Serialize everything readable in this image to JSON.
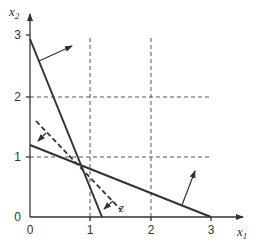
{
  "diagram": {
    "type": "linear-programming-graph",
    "axes": {
      "x_label": "x",
      "x_label_sub": "1",
      "y_label": "x",
      "y_label_sub": "2",
      "x_ticks": [
        "0",
        "1",
        "2",
        "3"
      ],
      "y_ticks": [
        "0",
        "1",
        "2",
        "3"
      ]
    },
    "constraint_lines": [
      {
        "name": "constraint-1",
        "from": [
          0,
          2.9
        ],
        "to": [
          1.2,
          0
        ],
        "style": "solid"
      },
      {
        "name": "constraint-2",
        "from": [
          0,
          1.2
        ],
        "to": [
          3,
          0
        ],
        "style": "solid"
      }
    ],
    "objective_line": {
      "label": "z",
      "from": [
        0.1,
        1.6
      ],
      "to": [
        1.45,
        0.1
      ],
      "style": "dashed"
    },
    "grid_lines": {
      "x": [
        1,
        2
      ],
      "y": [
        1,
        2
      ],
      "style": "dashed"
    },
    "colors": {
      "line": "#333333",
      "grid": "#555555",
      "background": "#ffffff"
    }
  }
}
